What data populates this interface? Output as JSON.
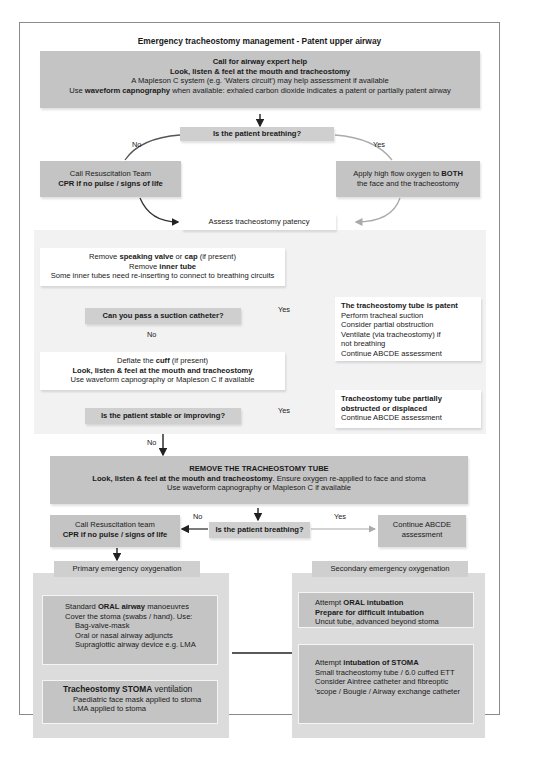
{
  "title": "Emergency tracheostomy management - Patent upper airway",
  "colors": {
    "dark_box": "#c4c4c4",
    "light_panel": "#f2f2f2",
    "arrow_dark": "#333333",
    "arrow_light": "#aaaaaa",
    "border": "#8a8a8a"
  },
  "top_box": {
    "line1": "Call for airway expert help",
    "line2": "Look, listen & feel at the mouth and tracheostomy",
    "line3": "A Mapleson C system (e.g. 'Waters circuit') may help assessment if available",
    "line4_pre": "Use ",
    "line4_bold": "waveform capnography",
    "line4_post": " when available:  exhaled carbon dioxide indicates a patent or partially patent airway"
  },
  "q_breathing_1": "Is the patient breathing?",
  "no_label": "No",
  "yes_label": "Yes",
  "resus_box_1": {
    "line1": "Call Resuscitation Team",
    "line2": "CPR if no pulse / signs of life"
  },
  "oxygen_box": {
    "line1_pre": "Apply high flow oxygen to ",
    "line1_bold": "BOTH",
    "line2": "the face and the tracheostomy"
  },
  "assess_box": "Assess tracheostomy patency",
  "remove_box": {
    "l1_a": "Remove ",
    "l1_b": "speaking valve",
    "l1_c": " or ",
    "l1_d": "cap",
    "l1_e": " (if present)",
    "l2_a": "Remove ",
    "l2_b": "inner tube",
    "l3": "Some inner tubes need re-inserting to connect to breathing circuits"
  },
  "q_suction": "Can you pass a suction catheter?",
  "patent_box": {
    "heading": "The tracheostomy tube is patent",
    "items": [
      "Perform tracheal suction",
      "Consider partial obstruction",
      "Ventilate (via tracheostomy) if",
      "not breathing",
      "Continue ABCDE assessment"
    ]
  },
  "deflate_box": {
    "l1_a": "Deflate the ",
    "l1_b": "cuff",
    "l1_c": " (if present)",
    "l2": "Look, listen & feel at the mouth and tracheostomy",
    "l3": "Use waveform capnography or Mapleson C if available"
  },
  "q_stable": "Is the patient stable or improving?",
  "partial_box": {
    "line1": "Tracheostomy tube partially",
    "line2": "obstructed or displaced",
    "line3": "Continue ABCDE assessment"
  },
  "remove_tube_box": {
    "line1": "REMOVE THE TRACHEOSTOMY TUBE",
    "line2_bold": "Look, listen & feel at the mouth and tracheostomy",
    "line2_rest": ". Ensure oxygen re-applied to face and stoma",
    "line3": "Use waveform capnography or Mapleson C if available"
  },
  "q_breathing_2": "Is the patient breathing?",
  "resus_box_2": {
    "line1": "Call Resuscitation team",
    "line2": "CPR if no pulse / signs of life"
  },
  "continue_box": {
    "line1": "Continue ABCDE",
    "line2": "assessment"
  },
  "primary": {
    "header": "Primary emergency oxygenation",
    "box1": {
      "l1_a": "Standard ",
      "l1_b": "ORAL airway",
      "l1_c": " manoeuvres",
      "l2": "Cover the stoma (swabs / hand). Use:",
      "items": [
        "Bag-valve-mask",
        "Oral or nasal airway adjuncts",
        "Supraglottic airway device e.g. LMA"
      ]
    },
    "box2": {
      "l1_b": "Tracheostomy STOMA",
      "l1_c": " ventilation",
      "items": [
        "Paediatric face mask applied to stoma",
        "LMA applied to stoma"
      ]
    }
  },
  "secondary": {
    "header": "Secondary emergency oxygenation",
    "box1": {
      "l1_a": "Attempt ",
      "l1_b": "ORAL intubation",
      "l2": "Prepare for difficult intubation",
      "l3": "Uncut tube, advanced beyond stoma"
    },
    "box2": {
      "l1_a": "Attempt ",
      "l1_b": "intubation of STOMA",
      "items": [
        "Small tracheostomy tube / 6.0 cuffed ETT",
        "Consider Aintree catheter and fibreoptic",
        "'scope / Bougie / Airway exchange catheter"
      ]
    }
  }
}
